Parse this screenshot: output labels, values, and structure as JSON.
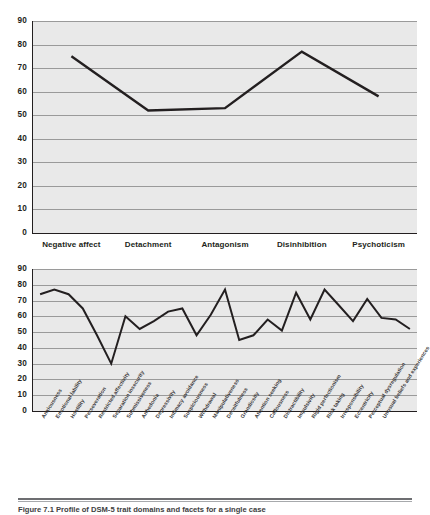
{
  "figure": {
    "caption": "Figure 7.1 Profile of DSM-5 trait domains and facets for a single case"
  },
  "chart_data": [
    {
      "id": "domain-profile",
      "type": "line",
      "title": "",
      "xlabel": "",
      "ylabel": "",
      "categories": [
        "Negative affect",
        "Detachment",
        "Antagonism",
        "Disinhibition",
        "Psychoticism"
      ],
      "values": [
        75,
        52,
        53,
        77,
        58
      ],
      "ylim": [
        0,
        90
      ],
      "yticks": [
        0,
        10,
        20,
        30,
        40,
        50,
        60,
        70,
        80,
        90
      ],
      "grid": true,
      "legend": "none",
      "line_color": "#231f20",
      "plot_background": "#e9e9e9"
    },
    {
      "id": "facet-profile",
      "type": "line",
      "title": "",
      "xlabel": "",
      "ylabel": "",
      "categories": [
        "Anxiousness",
        "Emotional lability",
        "Hostility",
        "Perseveration",
        "Restricted affectivity",
        "Separation insecurity",
        "Submissiveness",
        "Anhedonia",
        "Depressivity",
        "Intimacy avoidance",
        "Suspiciousness",
        "Withdrawal",
        "Manipulativeness",
        "Deceitfulness",
        "Grandiosity",
        "Attention seeking",
        "Callousness",
        "Distractibility",
        "Impulsivity",
        "Rigid perfectionism",
        "Risk taking",
        "Irresponsibility",
        "Eccentricity",
        "Perceptual dysregulation",
        "Unusual beliefs and experiences"
      ],
      "values": [
        74,
        77,
        74,
        65,
        48,
        30,
        60,
        52,
        57,
        63,
        65,
        48,
        61,
        77,
        45,
        48,
        58,
        51,
        75,
        58,
        77,
        67,
        57,
        71,
        59,
        58,
        52
      ],
      "ylim": [
        0,
        90
      ],
      "yticks": [
        0,
        10,
        20,
        30,
        40,
        50,
        60,
        70,
        80,
        90
      ],
      "grid": true,
      "legend": "none",
      "line_color": "#231f20",
      "plot_background": "#e9e9e9"
    }
  ]
}
